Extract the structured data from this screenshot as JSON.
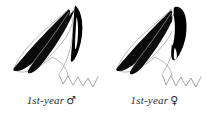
{
  "plate": {
    "background_color": "#ffffff",
    "ink_color": "#000000",
    "line_color": "#8a8a8a",
    "caption_color": "#2b2b2b",
    "style": "black-and-white field-guide line illustration"
  },
  "figures": [
    {
      "id": "first-year-male",
      "subject": "bird wing and tail plumage diagram",
      "caption_text": "1st-year",
      "caption_symbol": "♂",
      "caption_symbol_name": "male-symbol",
      "full_caption": "1st-year ♂",
      "elements": [
        "long dark primary feather",
        "second dark primary feather",
        "dark wedge-shaped tertial patch",
        "pale wing panel outline",
        "scalloped tail feather edge line"
      ]
    },
    {
      "id": "first-year-female",
      "subject": "bird wing and tail plumage diagram",
      "caption_text": "1st-year",
      "caption_symbol": "♀",
      "caption_symbol_name": "female-symbol",
      "full_caption": "1st-year ♀",
      "elements": [
        "long dark primary feather",
        "second dark primary feather",
        "broad solid-black tertial block",
        "pale wing panel outline",
        "scalloped tail feather edge line"
      ]
    }
  ]
}
